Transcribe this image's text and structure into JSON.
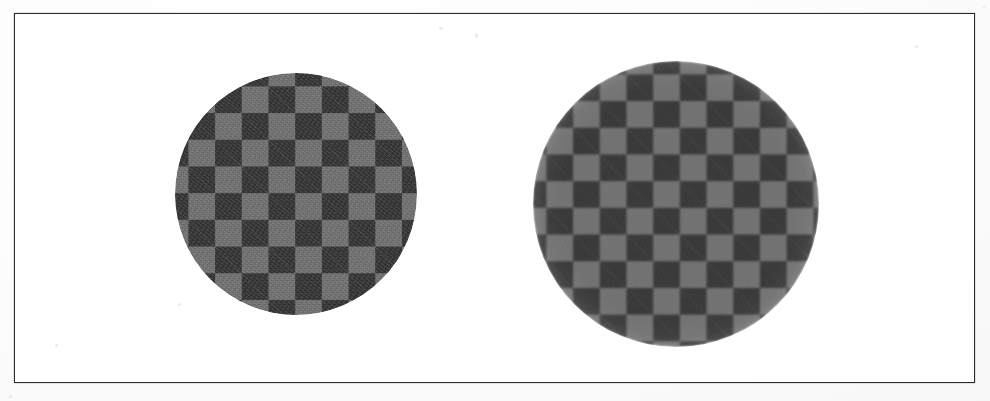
{
  "figure": {
    "title": "",
    "caption": "",
    "background_color": "#ffffff",
    "frame_color": "#2b2b2b",
    "frame": {
      "x": 14,
      "y": 13,
      "width": 961,
      "height": 370
    }
  },
  "panels": [
    {
      "id": "hard-aperture-disc",
      "label": "",
      "aperture": "hard-edge",
      "description": "Checkerboard disc with a sharp circular aperture",
      "center": {
        "x": 295,
        "y": 193
      },
      "radius": 121,
      "checker_period_px": 26.7,
      "light_square_color": "#737373",
      "dark_square_color": "#343434"
    },
    {
      "id": "soft-aperture-disc",
      "label": "",
      "aperture": "soft-edge",
      "description": "Checkerboard disc with a blurred, feathered circular aperture",
      "center": {
        "x": 675,
        "y": 203
      },
      "radius_inner": 83,
      "radius_outer": 143,
      "checker_period_px": 26.7,
      "light_square_color": "#737373",
      "dark_square_color": "#343434"
    }
  ],
  "chart_data": {
    "type": "heatmap",
    "title": "",
    "xlabel": "",
    "ylabel": "",
    "grid": false,
    "legend": "none",
    "series": [
      {
        "name": "hard-aperture-disc",
        "aperture_profile": "step",
        "center_x": 295,
        "center_y": 193,
        "radius": 121,
        "check_size_px": 26.7,
        "checks_across_diameter": 9,
        "luminance_light": 0.45,
        "luminance_dark": 0.2
      },
      {
        "name": "soft-aperture-disc",
        "aperture_profile": "gaussian-feather",
        "center_x": 675,
        "center_y": 203,
        "radius_full_contrast": 83,
        "radius_zero_contrast": 143,
        "check_size_px": 26.7,
        "checks_across_diameter": 11,
        "luminance_light": 0.45,
        "luminance_dark": 0.2
      }
    ]
  }
}
